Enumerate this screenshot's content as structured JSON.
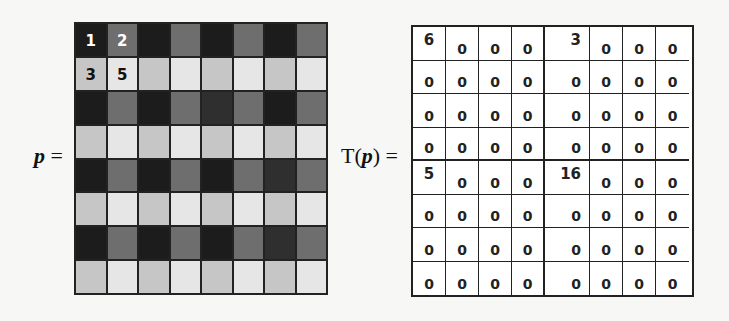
{
  "labels": {
    "p_var": "p",
    "p_eq": " =",
    "tp_prefix": "T(",
    "tp_var": "p",
    "tp_suffix": ") ="
  },
  "colors": {
    "D": "#1c1c1c",
    "d": "#2f2f2f",
    "M": "#6e6e6e",
    "L": "#c6c6c6",
    "W": "#e6e6e6"
  },
  "image_p": {
    "rows": [
      [
        "D",
        "M",
        "D",
        "M",
        "D",
        "M",
        "D",
        "M"
      ],
      [
        "L",
        "W",
        "L",
        "W",
        "L",
        "W",
        "L",
        "W"
      ],
      [
        "D",
        "M",
        "D",
        "M",
        "d",
        "M",
        "D",
        "M"
      ],
      [
        "L",
        "W",
        "L",
        "W",
        "L",
        "W",
        "L",
        "W"
      ],
      [
        "D",
        "M",
        "D",
        "M",
        "D",
        "M",
        "d",
        "M"
      ],
      [
        "L",
        "W",
        "L",
        "W",
        "L",
        "W",
        "L",
        "W"
      ],
      [
        "D",
        "M",
        "D",
        "M",
        "D",
        "M",
        "d",
        "M"
      ],
      [
        "L",
        "W",
        "L",
        "W",
        "L",
        "W",
        "L",
        "W"
      ]
    ],
    "annotations": [
      {
        "row": 0,
        "col": 0,
        "text": "1",
        "color": "#ffffff"
      },
      {
        "row": 0,
        "col": 1,
        "text": "2",
        "color": "#ffffff"
      },
      {
        "row": 1,
        "col": 0,
        "text": "3",
        "color": "#111111"
      },
      {
        "row": 1,
        "col": 1,
        "text": "5",
        "color": "#111111"
      }
    ]
  },
  "transform_Tp": {
    "rows": [
      [
        "6",
        "0",
        "0",
        "0",
        "3",
        "0",
        "0",
        "0"
      ],
      [
        "0",
        "0",
        "0",
        "0",
        "0",
        "0",
        "0",
        "0"
      ],
      [
        "0",
        "0",
        "0",
        "0",
        "0",
        "0",
        "0",
        "0"
      ],
      [
        "0",
        "0",
        "0",
        "0",
        "0",
        "0",
        "0",
        "0"
      ],
      [
        "5",
        "0",
        "0",
        "0",
        "16",
        "0",
        "0",
        "0"
      ],
      [
        "0",
        "0",
        "0",
        "0",
        "0",
        "0",
        "0",
        "0"
      ],
      [
        "0",
        "0",
        "0",
        "0",
        "0",
        "0",
        "0",
        "0"
      ],
      [
        "0",
        "0",
        "0",
        "0",
        "0",
        "0",
        "0",
        "0"
      ]
    ]
  }
}
